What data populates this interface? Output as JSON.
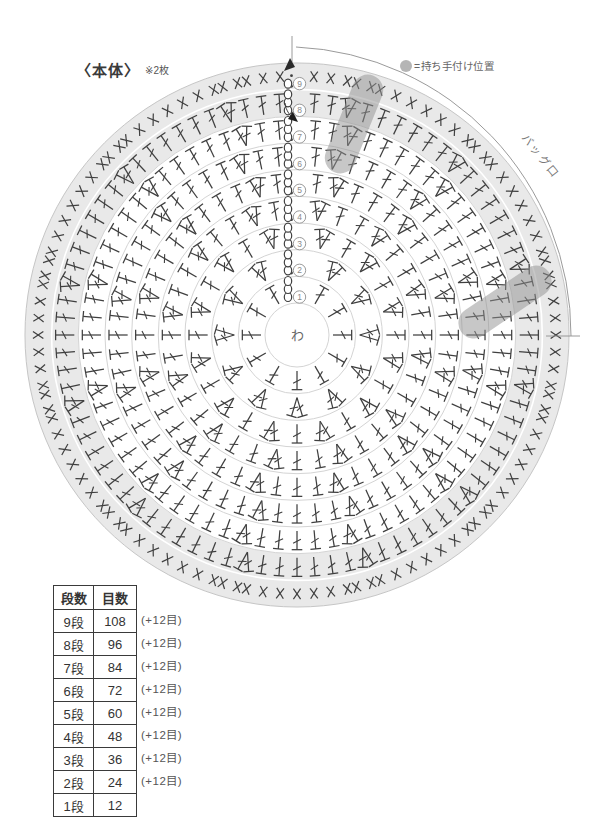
{
  "title": {
    "main": "〈本体〉",
    "note": "※2枚"
  },
  "legend": {
    "label": "=持ち手付け位置"
  },
  "diagram": {
    "arc_label": "バッグ口",
    "center_label": "わ",
    "accent_band_color": "#e9e9e9",
    "handle_marker_color": "#8f8f8f",
    "rounds": [
      {
        "num": 1,
        "symbol": "dc",
        "stitches": 12
      },
      {
        "num": 2,
        "symbol": "dc",
        "stitches": 24
      },
      {
        "num": 3,
        "symbol": "dc",
        "stitches": 36
      },
      {
        "num": 4,
        "symbol": "dc",
        "stitches": 48
      },
      {
        "num": 5,
        "symbol": "dc",
        "stitches": 60
      },
      {
        "num": 6,
        "symbol": "dc",
        "stitches": 72
      },
      {
        "num": 7,
        "symbol": "dc",
        "stitches": 84
      },
      {
        "num": 8,
        "symbol": "dc",
        "stitches": 96
      },
      {
        "num": 9,
        "symbol": "sc",
        "stitches": 108
      }
    ]
  },
  "table": {
    "headers": [
      "段数",
      "目数"
    ],
    "rows": [
      {
        "round": "9段",
        "count": "108",
        "note": "(+12目)"
      },
      {
        "round": "8段",
        "count": "96",
        "note": "(+12目)"
      },
      {
        "round": "7段",
        "count": "84",
        "note": "(+12目)"
      },
      {
        "round": "6段",
        "count": "72",
        "note": "(+12目)"
      },
      {
        "round": "5段",
        "count": "60",
        "note": "(+12目)"
      },
      {
        "round": "4段",
        "count": "48",
        "note": "(+12目)"
      },
      {
        "round": "3段",
        "count": "36",
        "note": "(+12目)"
      },
      {
        "round": "2段",
        "count": "24",
        "note": "(+12目)"
      },
      {
        "round": "1段",
        "count": "12",
        "note": ""
      }
    ]
  }
}
